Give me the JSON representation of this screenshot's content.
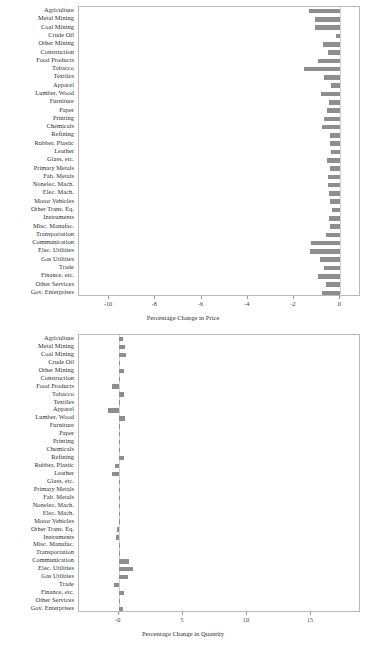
{
  "chart_data": [
    {
      "type": "bar",
      "orientation": "horizontal",
      "title": "",
      "xlabel": "Percentage Change in Price",
      "ylabel": "",
      "xlim": [
        -11.3,
        0.9
      ],
      "xticks": [
        -10,
        -8,
        -6,
        -4,
        -2,
        0
      ],
      "xticklabels": [
        "-10",
        "-8",
        "-6",
        "-4",
        "-2",
        "0"
      ],
      "grid": false,
      "legend": false,
      "bar_color": "#8e8e8e",
      "categories": [
        "Agriculture",
        "Metal Mining",
        "Coal Mining",
        "Crude Oil",
        "Other Mining",
        "Construction",
        "Food Products",
        "Tobacco",
        "Textiles",
        "Apparel",
        "Lumber, Wood",
        "Furniture",
        "Paper",
        "Printing",
        "Chemicals",
        "Refining",
        "Rubber, Plastic",
        "Leather",
        "Glass, etc.",
        "Primary Metals",
        "Fab. Metals",
        "Nonelec. Mach.",
        "Elec. Mach.",
        "Motor Vehicles",
        "Other Trans. Eq.",
        "Instruments",
        "Misc. Manufac.",
        "Transportation",
        "Communication",
        "Elec. Utilities",
        "Gas Utilities",
        "Trade",
        "Finance, etc.",
        "Other Services",
        "Gov. Enterprises"
      ],
      "values": [
        -1.37,
        -1.09,
        -1.09,
        -0.2,
        -0.75,
        -0.53,
        -0.94,
        -1.55,
        -0.69,
        -0.4,
        -0.85,
        -0.49,
        -0.55,
        -0.69,
        -0.77,
        -0.45,
        -0.45,
        -0.41,
        -0.59,
        -0.45,
        -0.51,
        -0.53,
        -0.49,
        -0.45,
        -0.37,
        -0.49,
        -0.43,
        -0.61,
        -1.27,
        -1.29,
        -0.89,
        -0.69,
        -0.97,
        -0.61,
        -0.79
      ]
    },
    {
      "type": "bar",
      "orientation": "horizontal",
      "title": "",
      "xlabel": "Percentage Change in Quantity",
      "ylabel": "",
      "xlim": [
        -3.1,
        18.9
      ],
      "xticks": [
        0,
        5,
        10,
        15
      ],
      "xticklabels": [
        "-0",
        "5",
        "10",
        "15"
      ],
      "grid": false,
      "legend": false,
      "bar_color": "#8e8e8e",
      "categories": [
        "Agriculture",
        "Metal Mining",
        "Coal Mining",
        "Crude Oil",
        "Other Mining",
        "Construction",
        "Food Products",
        "Tobacco",
        "Textiles",
        "Apparel",
        "Lumber, Wood",
        "Furniture",
        "Paper",
        "Printing",
        "Chemicals",
        "Refining",
        "Rubber, Plastic",
        "Leather",
        "Glass, etc.",
        "Primary Metals",
        "Fab. Metals",
        "Nonelec. Mach.",
        "Elec. Mach.",
        "Motor Vehicles",
        "Other Trans. Eq.",
        "Instruments",
        "Misc. Manufac.",
        "Transportation",
        "Communication",
        "Elec. Utilities",
        "Gas Utilities",
        "Trade",
        "Finance, etc.",
        "Other Services",
        "Gov. Enterprises"
      ],
      "values": [
        0.3,
        0.45,
        0.6,
        0.12,
        0.42,
        0.06,
        -0.55,
        0.4,
        0.02,
        -0.85,
        0.5,
        0.05,
        0.08,
        0.09,
        0.1,
        0.42,
        -0.28,
        -0.5,
        0.06,
        0.03,
        0.04,
        0.04,
        0.05,
        0.03,
        -0.12,
        -0.2,
        0.01,
        0.02,
        0.8,
        1.1,
        0.75,
        -0.35,
        0.4,
        0.02,
        0.3
      ]
    }
  ],
  "figure": {
    "top_chart": {
      "axis_title": "Percentage Change in Price"
    },
    "bottom_chart": {
      "axis_title": "Percentage Change in Quantity"
    }
  }
}
